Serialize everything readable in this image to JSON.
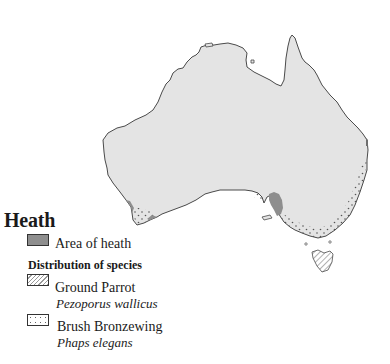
{
  "legend": {
    "title": "Heath",
    "area_label": "Area of heath",
    "distribution_heading": "Distribution of species",
    "species": [
      {
        "common": "Ground Parrot",
        "latin": "Pezoporus wallicus",
        "pattern": "hatched"
      },
      {
        "common": "Brush Bronzewing",
        "latin": "Phaps elegans",
        "pattern": "dotted"
      }
    ]
  },
  "colors": {
    "land": "#e4e4e4",
    "heath": "#8e8e8e",
    "coast": "#4a4a4a",
    "background": "#ffffff"
  },
  "map": {
    "region": "Australia",
    "features": [
      "heath-areas",
      "ground-parrot-range",
      "brush-bronzewing-range",
      "tasmania"
    ]
  }
}
